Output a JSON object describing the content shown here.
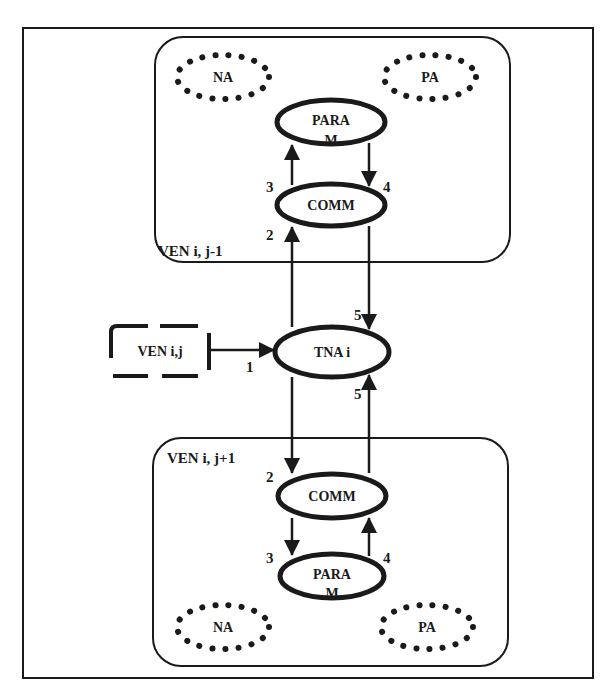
{
  "diagram": {
    "colors": {
      "stroke": "#1a1a1a",
      "background": "#ffffff"
    },
    "external": {
      "label": "VEN i,j"
    },
    "center": {
      "label": "TNA i"
    },
    "top_group": {
      "label": "VEN i, j-1",
      "na": "NA",
      "pa": "PA",
      "param_line1": "PARA",
      "param_line2": "M",
      "comm": "COMM"
    },
    "bottom_group": {
      "label": "VEN i, j+1",
      "na": "NA",
      "pa": "PA",
      "param_line1": "PARA",
      "param_line2": "M",
      "comm": "COMM"
    },
    "edges": {
      "e1": "1",
      "top_e2": "2",
      "top_e3": "3",
      "top_e4": "4",
      "top_e5": "5",
      "bot_e2": "2",
      "bot_e3": "3",
      "bot_e4": "4",
      "bot_e5": "5"
    }
  }
}
